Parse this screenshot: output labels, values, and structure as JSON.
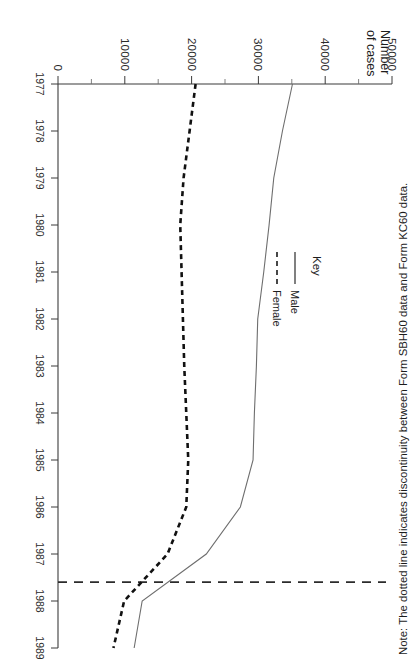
{
  "figure": {
    "orientation": "page rotated 90 degrees counter-clockwise",
    "note": "Note: The dotted line indicates discontinuity between Form SBH60 data and Form KC60 data."
  },
  "legend": {
    "title": "Key",
    "items": [
      {
        "label": "Male",
        "style": "solid"
      },
      {
        "label": "Female",
        "style": "dashed"
      }
    ]
  },
  "axes": {
    "y_title_line1": "Number",
    "y_title_line2": "of cases",
    "y_ticks": [
      "50000",
      "40000",
      "30000",
      "20000",
      "10000",
      "0"
    ],
    "x_ticks": [
      "1977",
      "1978",
      "1979",
      "1980",
      "1981",
      "1982",
      "1983",
      "1984",
      "1985",
      "1986",
      "1987",
      "1988",
      "1989"
    ]
  },
  "chart_data": {
    "type": "line",
    "title": "",
    "xlabel": "",
    "ylabel": "Number of cases",
    "x": [
      1977,
      1978,
      1979,
      1980,
      1981,
      1982,
      1983,
      1984,
      1985,
      1986,
      1987,
      1988,
      1989
    ],
    "xlim": [
      1977,
      1989
    ],
    "ylim": [
      0,
      50000
    ],
    "ytick_values": [
      0,
      10000,
      20000,
      30000,
      40000,
      50000
    ],
    "ytick_minor_step": 5000,
    "grid": false,
    "legend_position": "upper-centre-left",
    "series": [
      {
        "name": "Male",
        "style": "solid",
        "color": "#6e6e6e",
        "values": [
          35100,
          33600,
          32300,
          31600,
          30800,
          29900,
          29700,
          29400,
          29200,
          27300,
          22200,
          12600,
          11400
        ]
      },
      {
        "name": "Female",
        "style": "dashed",
        "color": "#111111",
        "values": [
          20600,
          19700,
          18800,
          18300,
          18500,
          18700,
          18900,
          19200,
          19500,
          19200,
          16400,
          9900,
          8300
        ]
      }
    ],
    "annotations": [
      {
        "kind": "discontinuity-line",
        "style": "dashed",
        "x": 1987.6,
        "description": "Vertical (in chart orientation) dashed line marking discontinuity between Form SBH60 data and Form KC60 data"
      }
    ]
  }
}
